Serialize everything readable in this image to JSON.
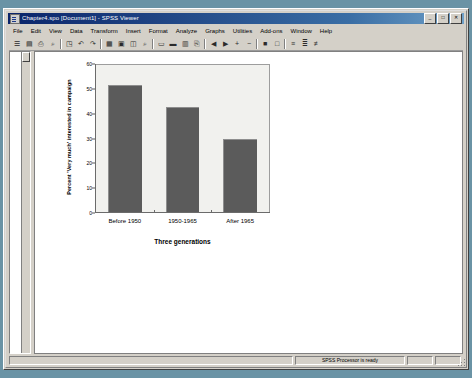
{
  "window": {
    "title": "Chapter4.spo [Document1] - SPSS Viewer",
    "icon": "spss-viewer-icon",
    "buttons": [
      {
        "name": "minimize",
        "glyph": "_"
      },
      {
        "name": "maximize",
        "glyph": "□"
      },
      {
        "name": "close",
        "glyph": "✕"
      }
    ]
  },
  "menubar": {
    "items": [
      {
        "name": "file",
        "label": "File"
      },
      {
        "name": "edit",
        "label": "Edit"
      },
      {
        "name": "view",
        "label": "View"
      },
      {
        "name": "data",
        "label": "Data"
      },
      {
        "name": "transform",
        "label": "Transform"
      },
      {
        "name": "insert",
        "label": "Insert"
      },
      {
        "name": "format",
        "label": "Format"
      },
      {
        "name": "analyze",
        "label": "Analyze"
      },
      {
        "name": "graphs",
        "label": "Graphs"
      },
      {
        "name": "utilities",
        "label": "Utilities"
      },
      {
        "name": "add-ons",
        "label": "Add-ons"
      },
      {
        "name": "window",
        "label": "Window"
      },
      {
        "name": "help",
        "label": "Help"
      }
    ]
  },
  "toolbar": {
    "buttons": [
      {
        "name": "open-file-icon",
        "glyph": "☰"
      },
      {
        "name": "save-icon",
        "glyph": "▤"
      },
      {
        "name": "print-icon",
        "glyph": "⎙"
      },
      {
        "name": "print-preview-icon",
        "glyph": "⌕"
      },
      {
        "name": "recall-dialog-icon",
        "glyph": "◳"
      },
      {
        "name": "undo-icon",
        "glyph": "↶"
      },
      {
        "name": "redo-icon",
        "glyph": "↷"
      },
      {
        "name": "goto-data-icon",
        "glyph": "▦"
      },
      {
        "name": "goto-case-icon",
        "glyph": "▣"
      },
      {
        "name": "variables-icon",
        "glyph": "◫"
      },
      {
        "name": "find-icon",
        "glyph": "⌕"
      },
      {
        "name": "insert-heading-icon",
        "glyph": "▭"
      },
      {
        "name": "insert-title-icon",
        "glyph": "▬"
      },
      {
        "name": "insert-text-icon",
        "glyph": "▥"
      },
      {
        "name": "export-icon",
        "glyph": "⎘"
      },
      {
        "name": "promote-icon",
        "glyph": "◀"
      },
      {
        "name": "demote-icon",
        "glyph": "▶"
      },
      {
        "name": "expand-icon",
        "glyph": "+"
      },
      {
        "name": "collapse-icon",
        "glyph": "−"
      },
      {
        "name": "show-icon",
        "glyph": "■"
      },
      {
        "name": "hide-icon",
        "glyph": "□"
      },
      {
        "name": "align-left-icon",
        "glyph": "≡"
      },
      {
        "name": "align-center-icon",
        "glyph": "≣"
      },
      {
        "name": "align-right-icon",
        "glyph": "≢"
      }
    ]
  },
  "outline": {
    "name": "outline-pane",
    "scrollbar_name": "outline-scrollbar"
  },
  "statusbar": {
    "message": "",
    "ready": "SPSS Processor is ready",
    "cell1": "",
    "cell2": ""
  },
  "chart_data": {
    "type": "bar",
    "title": "",
    "categories": [
      "Before 1950",
      "1950-1965",
      "After 1965"
    ],
    "values": [
      52,
      43,
      30
    ],
    "xlabel": "Three generations",
    "ylabel": "Percent 'Very much' interested in campaign",
    "ylim": [
      0,
      60
    ],
    "yticks": [
      0,
      10,
      20,
      30,
      40,
      50,
      60
    ],
    "grid": false,
    "legend": "none",
    "bar_color": "#5b5b5b",
    "plot_background": "#f1f1ee"
  }
}
